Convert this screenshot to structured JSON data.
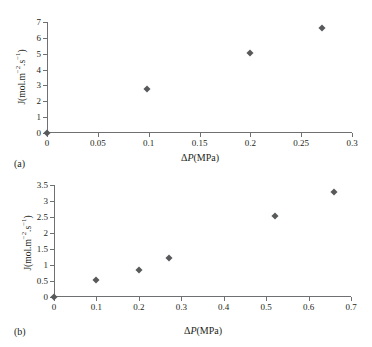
{
  "figure": {
    "background": "#ffffff",
    "axis_color": "#6f7072",
    "marker_color": "#58595b",
    "text_color": "#231f20"
  },
  "panels": {
    "a": {
      "label": "(a)",
      "xlabel_delta": "Δ",
      "xlabel_p": "P",
      "xlabel_unit": "(MPa)",
      "ylabel_prefix": "J(mol.m",
      "ylabel_sup1": "−2",
      "ylabel_mid": ".s",
      "ylabel_sup2": "−1",
      "ylabel_suffix": ")",
      "xticks": [
        "0",
        "0.05",
        "0.1",
        "0.15",
        "0.2",
        "0.25",
        "0.3"
      ],
      "yticks": [
        "0",
        "1",
        "2",
        "3",
        "4",
        "5",
        "6",
        "7"
      ]
    },
    "b": {
      "label": "(b)",
      "xlabel_delta": "Δ",
      "xlabel_p": "P",
      "xlabel_unit": "(MPa)",
      "ylabel_prefix": "J(mol.m",
      "ylabel_sup1": "−2",
      "ylabel_mid": ".s",
      "ylabel_sup2": "−1",
      "ylabel_suffix": ")",
      "xticks": [
        "0",
        "0.1",
        "0.2",
        "0.3",
        "0.4",
        "0.5",
        "0.6",
        "0.7"
      ],
      "yticks": [
        "0",
        "0.5",
        "1",
        "1.5",
        "2",
        "2.5",
        "3",
        "3.5"
      ]
    }
  },
  "chart_data": [
    {
      "type": "scatter",
      "panel": "a",
      "title": "",
      "xlabel": "ΔP(MPa)",
      "ylabel": "J(mol.m−2.s−1)",
      "xlim": [
        0,
        0.3
      ],
      "ylim": [
        0,
        7
      ],
      "xticks": [
        0,
        0.05,
        0.1,
        0.15,
        0.2,
        0.25,
        0.3
      ],
      "yticks": [
        0,
        1,
        2,
        3,
        4,
        5,
        6,
        7
      ],
      "grid": false,
      "legend": "none",
      "marker": "diamond",
      "series": [
        {
          "name": "flux",
          "points": [
            {
              "x": 0.0,
              "y": 0.0
            },
            {
              "x": 0.098,
              "y": 2.75
            },
            {
              "x": 0.2,
              "y": 5.05
            },
            {
              "x": 0.27,
              "y": 6.6
            }
          ]
        }
      ]
    },
    {
      "type": "scatter",
      "panel": "b",
      "title": "",
      "xlabel": "ΔP(MPa)",
      "ylabel": "J(mol.m−2.s−1)",
      "xlim": [
        0,
        0.7
      ],
      "ylim": [
        0,
        3.5
      ],
      "xticks": [
        0,
        0.1,
        0.2,
        0.3,
        0.4,
        0.5,
        0.6,
        0.7
      ],
      "yticks": [
        0,
        0.5,
        1,
        1.5,
        2,
        2.5,
        3,
        3.5
      ],
      "grid": false,
      "legend": "none",
      "marker": "diamond",
      "series": [
        {
          "name": "flux",
          "points": [
            {
              "x": 0.0,
              "y": 0.0
            },
            {
              "x": 0.1,
              "y": 0.54
            },
            {
              "x": 0.2,
              "y": 0.85
            },
            {
              "x": 0.27,
              "y": 1.21
            },
            {
              "x": 0.52,
              "y": 2.54
            },
            {
              "x": 0.66,
              "y": 3.28
            }
          ]
        }
      ]
    }
  ]
}
